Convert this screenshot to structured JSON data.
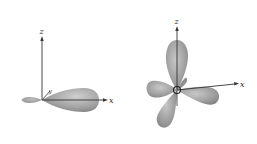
{
  "figure": {
    "colors": {
      "lobe_fill": "#9a9a9a",
      "lobe_light": "#c4c4c4",
      "lobe_dark": "#7a7a7a",
      "axis": "#333333",
      "background": "#ffffff"
    }
  },
  "left_diagram": {
    "name": "single hybrid orbital",
    "axes": {
      "z_label": "z",
      "x_label": "x",
      "y_label": "y"
    },
    "lobes": [
      {
        "direction": "+x",
        "size": "large"
      },
      {
        "direction": "-x",
        "size": "small"
      }
    ]
  },
  "right_diagram": {
    "name": "sp3 tetrahedral hybrid orbitals",
    "axes": {
      "z_label": "z",
      "x_label": "x"
    },
    "lobes": [
      {
        "direction": "+z",
        "size": "large"
      },
      {
        "direction": "+x lower-right",
        "size": "large"
      },
      {
        "direction": "lower-left",
        "size": "large"
      },
      {
        "direction": "left",
        "size": "large"
      }
    ]
  }
}
